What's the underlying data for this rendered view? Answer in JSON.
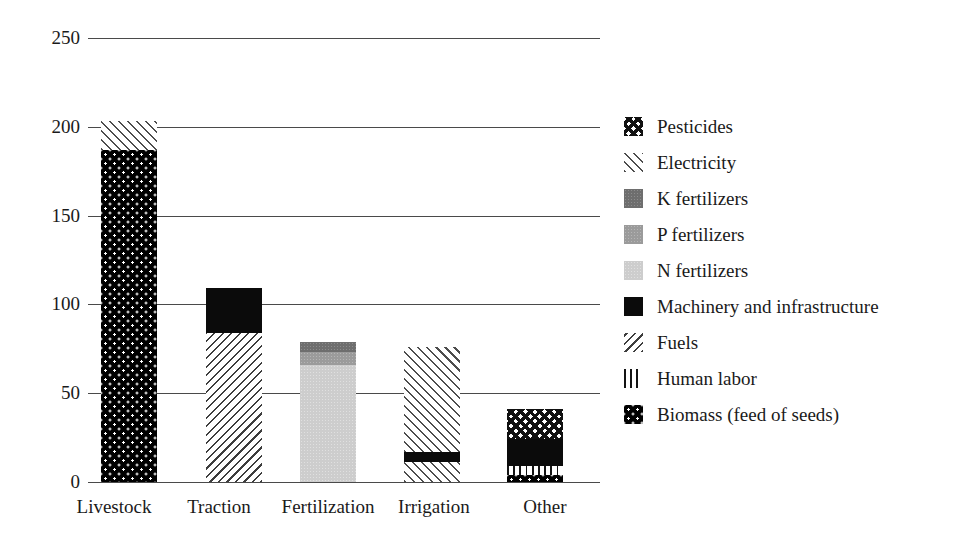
{
  "chart_data": {
    "type": "bar",
    "subtype": "stacked-bar",
    "title": "",
    "xlabel": "",
    "ylabel": "",
    "ylim": [
      0,
      250
    ],
    "yticks": [
      0,
      50,
      100,
      150,
      200,
      250
    ],
    "ytick_labels": [
      "0",
      "50",
      "100",
      "150",
      "200",
      "250"
    ],
    "grid": "horizontal",
    "legend_position": "right",
    "categories": [
      "Livestock",
      "Traction",
      "Fertilization",
      "Irrigation",
      "Other"
    ],
    "series": [
      {
        "name": "Pesticides",
        "values": [
          0,
          0,
          0,
          0,
          17
        ]
      },
      {
        "name": "Electricity",
        "values": [
          16,
          0,
          0,
          59,
          0
        ]
      },
      {
        "name": "K fertilizers",
        "values": [
          0,
          0,
          6,
          0,
          0
        ]
      },
      {
        "name": "P fertilizers",
        "values": [
          0,
          0,
          7,
          0,
          0
        ]
      },
      {
        "name": "N fertilizers",
        "values": [
          0,
          0,
          66,
          0,
          0
        ]
      },
      {
        "name": "Machinery and infrastructure",
        "values": [
          0,
          25,
          0,
          6,
          15
        ]
      },
      {
        "name": "Fuels",
        "values": [
          0,
          84,
          0,
          0,
          0
        ]
      },
      {
        "name": "Human labor",
        "values": [
          0,
          0,
          0,
          0,
          5
        ]
      },
      {
        "name": "Biomass (feed of seeds)",
        "values": [
          187,
          0,
          0,
          11,
          4
        ]
      }
    ],
    "totals": [
      203,
      109,
      79,
      76,
      41
    ],
    "stack_order_bottom_to_top": [
      "Biomass (feed of seeds)",
      "Human labor",
      "Fuels",
      "Machinery and infrastructure",
      "N fertilizers",
      "P fertilizers",
      "K fertilizers",
      "Electricity",
      "Pesticides"
    ],
    "bars": [
      {
        "category": "Livestock",
        "total": 203,
        "segments": [
          {
            "series": "Biomass (feed of seeds)",
            "start": 0,
            "end": 187,
            "value": 187,
            "pattern": "black-with-white-dots"
          },
          {
            "series": "Electricity",
            "start": 187,
            "end": 203,
            "value": 16,
            "pattern": "light-diagonal-hatch"
          }
        ]
      },
      {
        "category": "Traction",
        "total": 109,
        "segments": [
          {
            "series": "Fuels",
            "start": 0,
            "end": 84,
            "value": 84,
            "pattern": "fine-diagonal-hatch"
          },
          {
            "series": "Machinery and infrastructure",
            "start": 84,
            "end": 109,
            "value": 25,
            "pattern": "solid-black"
          }
        ]
      },
      {
        "category": "Fertilization",
        "total": 79,
        "segments": [
          {
            "series": "N fertilizers",
            "start": 0,
            "end": 66,
            "value": 66,
            "pattern": "light-gray"
          },
          {
            "series": "P fertilizers",
            "start": 66,
            "end": 73,
            "value": 7,
            "pattern": "medium-gray"
          },
          {
            "series": "K fertilizers",
            "start": 73,
            "end": 79,
            "value": 6,
            "pattern": "dark-gray"
          }
        ]
      },
      {
        "category": "Irrigation",
        "total": 76,
        "segments": [
          {
            "series": "Electricity",
            "start": 0,
            "end": 11,
            "value": 11,
            "pattern": "light-diagonal-hatch"
          },
          {
            "series": "Machinery and infrastructure",
            "start": 11,
            "end": 17,
            "value": 6,
            "pattern": "solid-black"
          },
          {
            "series": "Electricity",
            "start": 17,
            "end": 76,
            "value": 59,
            "pattern": "light-diagonal-hatch"
          }
        ]
      },
      {
        "category": "Other",
        "total": 41,
        "segments": [
          {
            "series": "Biomass (feed of seeds)",
            "start": 0,
            "end": 4,
            "value": 4,
            "pattern": "black-with-white-dots"
          },
          {
            "series": "Human labor",
            "start": 4,
            "end": 9,
            "value": 5,
            "pattern": "vertical-lines"
          },
          {
            "series": "Machinery and infrastructure",
            "start": 9,
            "end": 24,
            "value": 15,
            "pattern": "solid-black"
          },
          {
            "series": "Pesticides",
            "start": 24,
            "end": 41,
            "value": 17,
            "pattern": "diagonal-crosshatch"
          }
        ]
      }
    ]
  },
  "axis": {
    "yticks": [
      "250",
      "200",
      "150",
      "100",
      "50",
      "0"
    ],
    "xticks": [
      "Livestock",
      "Traction",
      "Fertilization",
      "Irrigation",
      "Other"
    ]
  },
  "legend": {
    "items": [
      {
        "label": "Pesticides",
        "pattern": "diagonal-crosshatch"
      },
      {
        "label": "Electricity",
        "pattern": "light-diagonal-hatch"
      },
      {
        "label": "K fertilizers",
        "pattern": "dark-gray"
      },
      {
        "label": "P fertilizers",
        "pattern": "medium-gray"
      },
      {
        "label": "N fertilizers",
        "pattern": "light-gray"
      },
      {
        "label": "Machinery and infrastructure",
        "pattern": "solid-black"
      },
      {
        "label": "Fuels",
        "pattern": "fine-diagonal-hatch"
      },
      {
        "label": "Human labor",
        "pattern": "vertical-lines"
      },
      {
        "label": "Biomass (feed of seeds)",
        "pattern": "black-with-white-dots"
      }
    ]
  },
  "colors": {
    "axis": "#4a4a4a",
    "text": "#1a1a1a",
    "background": "#ffffff",
    "k_fertilizers": "#6e6e6e",
    "p_fertilizers": "#9b9b9b",
    "n_fertilizers": "#cdcdcd",
    "machinery": "#0b0b0b"
  }
}
